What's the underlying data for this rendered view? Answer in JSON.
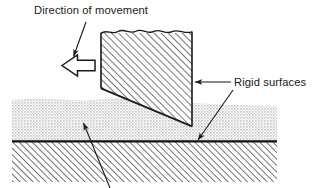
{
  "figure": {
    "background_color": "#ffffff",
    "width": 319,
    "height": 188
  },
  "labels": {
    "direction_of_movement": "Direction of movement",
    "rigid_surfaces": "Rigid surfaces"
  },
  "annotations": [
    {
      "name": "direction-of-movement",
      "text": "Direction of movement",
      "text_x": 34,
      "text_y": 14,
      "leader_from": [
        85,
        22
      ],
      "leader_to": [
        74,
        56
      ],
      "arrow": "thin-arrowhead"
    },
    {
      "name": "rigid-surfaces",
      "text": "Rigid surfaces",
      "text_x": 234,
      "text_y": 86,
      "leader_from": [
        231,
        82
      ],
      "leader_to": [
        194,
        82
      ],
      "arrow": "thin-arrowhead"
    },
    {
      "name": "rigid-surfaces-second-leader",
      "text": "",
      "leader_from": [
        233,
        89
      ],
      "leader_to": [
        197,
        141
      ],
      "arrow": "thin-arrowhead"
    },
    {
      "name": "lower-layer-leader",
      "text": "",
      "leader_from": [
        110,
        186
      ],
      "leader_to": [
        83,
        124
      ],
      "arrow": "thin-arrowhead"
    }
  ],
  "shapes": {
    "block_arrow": {
      "name": "movement-block-arrow",
      "description": "Hollow outlined block arrow pointing left",
      "fill": "#ffffff",
      "stroke": "#1a1a1a",
      "points": "62,65 77,55 77,60 95,60 95,71 77,71 77,76"
    },
    "wedge": {
      "name": "wedge-indenter",
      "description": "Hatched wedge with torn top edge, vertical sides, angled bottom face and tip",
      "fill_pattern": "diagonal-hatch",
      "stroke": "#1a1a1a",
      "left_edge_x": 101,
      "right_edge_x": 192,
      "top_y": 31,
      "left_bottom_y": 88,
      "tip": [
        192,
        126
      ]
    },
    "upper_layer": {
      "name": "stippled-upper-layer",
      "description": "Light gray stippled deformable layer with irregular top surface",
      "color": "#d9d9d9",
      "x_start": 12,
      "x_end": 277,
      "top_y": 98,
      "bottom_y": 141
    },
    "interface_line": {
      "name": "rigid-interface-line",
      "description": "Thick black horizontal boundary line",
      "color": "#111111",
      "y": 141,
      "x_start": 12,
      "x_end": 277,
      "thickness": 2.4
    },
    "lower_layer": {
      "name": "hatched-lower-layer",
      "description": "Diagonally hatched rigid substrate",
      "fill_pattern": "diagonal-hatch",
      "x_start": 12,
      "x_end": 277,
      "top_y": 141,
      "bottom_y": 182
    }
  },
  "colors": {
    "ink": "#1a1a1a",
    "hatch": "#555555",
    "stipple": "#d9d9d9",
    "paper": "#ffffff"
  }
}
